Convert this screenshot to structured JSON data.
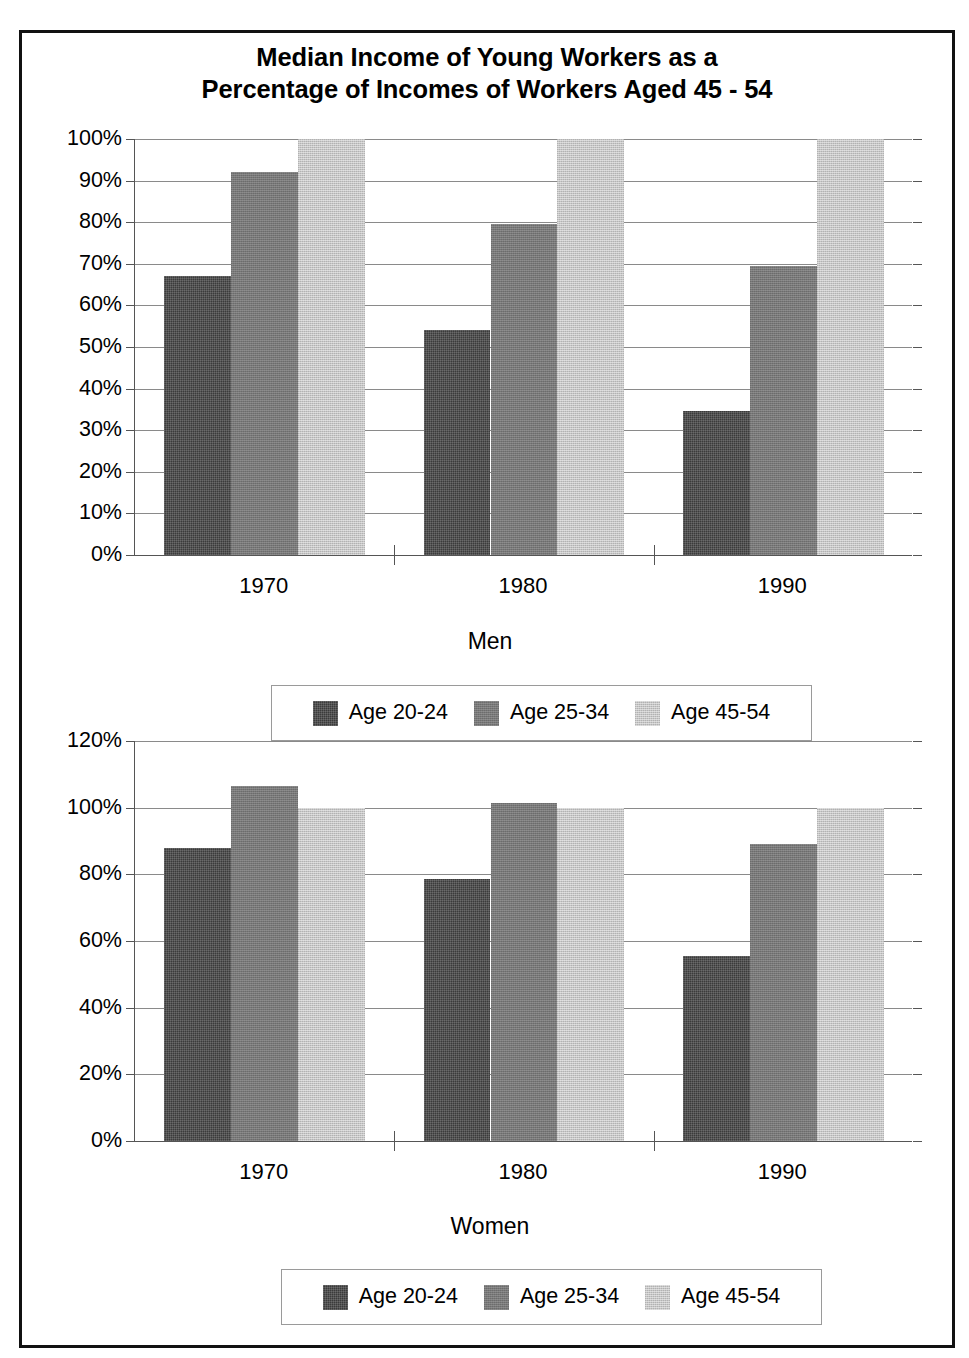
{
  "title": {
    "line1": "Median Income of Young Workers as a",
    "line2": "Percentage of Incomes of Workers Aged 45 - 54"
  },
  "colors": {
    "series_dark": "#3b3b3b",
    "series_mid": "#787878",
    "series_light": "#c6c6c6",
    "frame": "#111111",
    "gridline": "#8a8a8a",
    "axis": "#555555"
  },
  "panels": [
    {
      "key": "men",
      "axis_title": "Men",
      "y_ticks": [
        "100%",
        "90%",
        "80%",
        "70%",
        "60%",
        "50%",
        "40%",
        "30%",
        "20%",
        "10%",
        "0%"
      ],
      "x_ticks": [
        "1970",
        "1980",
        "1990"
      ],
      "legend": [
        {
          "label": "Age 20-24",
          "swatch": "series_dark"
        },
        {
          "label": "Age 25-34",
          "swatch": "series_mid"
        },
        {
          "label": "Age 45-54",
          "swatch": "series_light"
        }
      ]
    },
    {
      "key": "women",
      "axis_title": "Women",
      "y_ticks": [
        "120%",
        "100%",
        "80%",
        "60%",
        "40%",
        "20%",
        "0%"
      ],
      "x_ticks": [
        "1970",
        "1980",
        "1990"
      ],
      "legend": [
        {
          "label": "Age 20-24",
          "swatch": "series_dark"
        },
        {
          "label": "Age 25-34",
          "swatch": "series_mid"
        },
        {
          "label": "Age 45-54",
          "swatch": "series_light"
        }
      ]
    }
  ],
  "chart_data": [
    {
      "type": "bar",
      "title": "Median Income of Young Workers as a Percentage of Incomes of Workers Aged 45 - 54",
      "subtitle": "Men",
      "xlabel": "Men",
      "ylabel": "",
      "categories": [
        "1970",
        "1980",
        "1990"
      ],
      "series": [
        {
          "name": "Age 20-24",
          "values": [
            67,
            54,
            34.5
          ]
        },
        {
          "name": "Age 25-34",
          "values": [
            92,
            79.5,
            69.5
          ]
        },
        {
          "name": "Age 45-54",
          "values": [
            100,
            100,
            100
          ]
        }
      ],
      "ylim": [
        0,
        100
      ],
      "ytick_values": [
        0,
        10,
        20,
        30,
        40,
        50,
        60,
        70,
        80,
        90,
        100
      ],
      "ytick_labels": [
        "0%",
        "10%",
        "20%",
        "30%",
        "40%",
        "50%",
        "60%",
        "70%",
        "80%",
        "90%",
        "100%"
      ],
      "grid": true,
      "legend_position": "bottom",
      "units": "percent"
    },
    {
      "type": "bar",
      "title": "Median Income of Young Workers as a Percentage of Incomes of Workers Aged 45 - 54",
      "subtitle": "Women",
      "xlabel": "Women",
      "ylabel": "",
      "categories": [
        "1970",
        "1980",
        "1990"
      ],
      "series": [
        {
          "name": "Age 20-24",
          "values": [
            88,
            78.5,
            55.5
          ]
        },
        {
          "name": "Age 25-34",
          "values": [
            106.5,
            101.5,
            89
          ]
        },
        {
          "name": "Age 45-54",
          "values": [
            100,
            100,
            100
          ]
        }
      ],
      "ylim": [
        0,
        120
      ],
      "ytick_values": [
        0,
        20,
        40,
        60,
        80,
        100,
        120
      ],
      "ytick_labels": [
        "0%",
        "20%",
        "40%",
        "60%",
        "80%",
        "100%",
        "120%"
      ],
      "grid": true,
      "legend_position": "bottom",
      "units": "percent"
    }
  ]
}
